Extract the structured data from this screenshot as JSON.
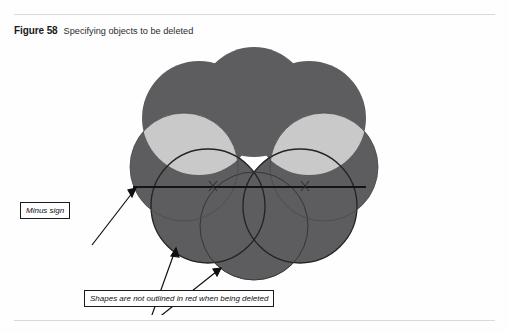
{
  "figure": {
    "label": "Figure 58",
    "caption": "Specifying objects to be deleted"
  },
  "callouts": [
    {
      "id": "minus-sign",
      "text": "Minus sign"
    },
    {
      "id": "shapes-not-outlined",
      "text": "Shapes are not outlined in red when being deleted"
    }
  ],
  "colors": {
    "shape_fill": "#5d5d5f",
    "shape_highlight": "#c9c9c9",
    "outline": "#1d1d1d",
    "rule": "#d9d9d9",
    "page_background": "#fefefe",
    "text": "#111111"
  },
  "illustration": {
    "description": "Cluster of overlapping circles selected for deletion, shown filled dark gray with two light-gray lens-shaped intersection regions near the top and a horizontal minus-sign cursor line crossing the middle.",
    "shape_kind": "circle-cluster",
    "filled_circles": 7,
    "highlight_lenses": 2,
    "outlined_circles": 2,
    "minus_line_present": true
  }
}
